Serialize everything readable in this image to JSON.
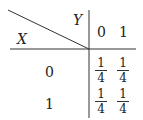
{
  "table": {
    "row_variable": "X",
    "col_variable": "Y",
    "col_headers": [
      "0",
      "1"
    ],
    "row_headers": [
      "0",
      "1"
    ],
    "cells": [
      [
        {
          "num": "1",
          "den": "4"
        },
        {
          "num": "1",
          "den": "4"
        }
      ],
      [
        {
          "num": "1",
          "den": "4"
        },
        {
          "num": "1",
          "den": "4"
        }
      ]
    ]
  }
}
